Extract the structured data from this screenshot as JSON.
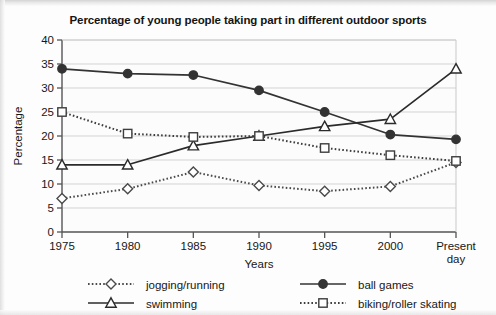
{
  "chart_data": {
    "type": "line",
    "title": "Percentage of young people taking part in different outdoor sports",
    "xlabel": "Years",
    "ylabel": "Percentage",
    "categories": [
      "1975",
      "1980",
      "1985",
      "1990",
      "1995",
      "2000",
      "Present day"
    ],
    "xtick_labels": [
      "1975",
      "1980",
      "1985",
      "1990",
      "1995",
      "2000",
      "Present\nday"
    ],
    "ytick_labels": [
      "0",
      "5",
      "10",
      "15",
      "20",
      "25",
      "30",
      "35",
      "40"
    ],
    "yticks": [
      0,
      5,
      10,
      15,
      20,
      25,
      30,
      35,
      40
    ],
    "ylim": [
      0,
      40
    ],
    "grid": "horizontal",
    "legend_position": "bottom",
    "series": [
      {
        "name": "jogging/running",
        "marker": "diamond-open",
        "line_style": "dotted",
        "color": "#4a4a4a",
        "values": [
          7,
          9,
          12.5,
          9.7,
          8.5,
          9.5,
          14.5
        ]
      },
      {
        "name": "ball games",
        "marker": "circle-filled",
        "line_style": "solid",
        "color": "#333333",
        "values": [
          34,
          33,
          32.7,
          29.5,
          25,
          20.3,
          19.3
        ]
      },
      {
        "name": "swimming",
        "marker": "triangle-open",
        "line_style": "solid",
        "color": "#2b2b2b",
        "values": [
          14,
          14,
          18,
          20,
          22,
          23.5,
          34
        ]
      },
      {
        "name": "biking/roller skating",
        "marker": "square-open",
        "line_style": "dotted",
        "color": "#3d3d3d",
        "values": [
          25,
          20.5,
          19.8,
          20,
          17.5,
          16,
          14.8
        ]
      }
    ]
  },
  "legend": {
    "items": [
      {
        "label": "jogging/running"
      },
      {
        "label": "ball games"
      },
      {
        "label": "swimming"
      },
      {
        "label": "biking/roller skating"
      }
    ]
  }
}
